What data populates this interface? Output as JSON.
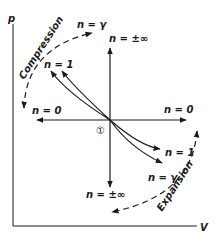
{
  "diagram": {
    "type": "p-V polytropic process diagram",
    "axes": {
      "y_label": "p",
      "x_label": "V"
    },
    "state_marker": "①",
    "process_labels": {
      "compression": "Compression",
      "expansion": "Expansion"
    },
    "curves": [
      {
        "id": "n-inf-up",
        "label": "n = ±∞",
        "direction": "up"
      },
      {
        "id": "n-inf-down",
        "label": "n = ±∞",
        "direction": "down"
      },
      {
        "id": "n-0-left",
        "label": "n = 0",
        "direction": "left"
      },
      {
        "id": "n-0-right",
        "label": "n = 0",
        "direction": "right"
      },
      {
        "id": "n-gamma-up",
        "label": "n = γ",
        "direction": "up-left"
      },
      {
        "id": "n-1-up",
        "label": "n = 1",
        "direction": "up-left"
      },
      {
        "id": "n-1-down",
        "label": "n = 1",
        "direction": "down-right"
      },
      {
        "id": "n-gamma-down",
        "label": "n = γ",
        "direction": "down-right"
      }
    ],
    "colors": {
      "ink": "#1a1a1a",
      "background": "#ffffff"
    }
  }
}
